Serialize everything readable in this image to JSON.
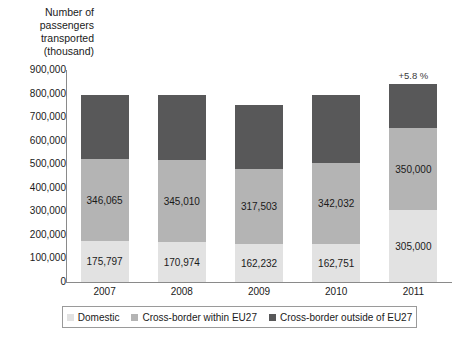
{
  "chart_data": {
    "type": "bar",
    "subtype": "stacked-column",
    "title": "",
    "ylabel": "Number of passengers transported (thousand)",
    "xlabel": "",
    "ylim": [
      0,
      900000
    ],
    "ytick_step": 100000,
    "grid": false,
    "legend_position": "bottom",
    "categories": [
      "2007",
      "2008",
      "2009",
      "2010",
      "2011"
    ],
    "ytick_labels": [
      "900,000",
      "800,000",
      "700,000",
      "600,000",
      "500,000",
      "400,000",
      "300,000",
      "200,000",
      "100,000",
      "0"
    ],
    "ytick_values": [
      900000,
      800000,
      700000,
      600000,
      500000,
      400000,
      300000,
      200000,
      100000,
      0
    ],
    "series": [
      {
        "name": "Domestic",
        "color": "#e2e2e2",
        "values": [
          175797,
          170974,
          162232,
          162751,
          305000
        ],
        "labels": [
          "175,797",
          "170,974",
          "162,232",
          "162,751",
          "305,000"
        ]
      },
      {
        "name": "Cross-border within EU27",
        "color": "#b4b4b4",
        "values": [
          346065,
          345010,
          317503,
          342032,
          350000
        ],
        "labels": [
          "346,065",
          "345,010",
          "317,503",
          "342,032",
          "350,000"
        ]
      },
      {
        "name": "Cross-border outside of EU27",
        "color": "#585859",
        "values": [
          273138,
          279016,
          270265,
          290217,
          185000
        ],
        "labels": [
          "",
          "",
          "",
          "",
          ""
        ]
      }
    ],
    "totals": [
      795000,
      795000,
      750000,
      795000,
      840000
    ],
    "annotations": [
      {
        "category": "2011",
        "text": "+5.8 %"
      }
    ]
  },
  "legend": {
    "items": [
      {
        "label": "Domestic",
        "color": "#e2e2e2"
      },
      {
        "label": "Cross-border within EU27",
        "color": "#b4b4b4"
      },
      {
        "label": "Cross-border outside of EU27",
        "color": "#585859"
      }
    ]
  },
  "axis_title": "Number of\npassengers\ntransported\n(thousand)"
}
